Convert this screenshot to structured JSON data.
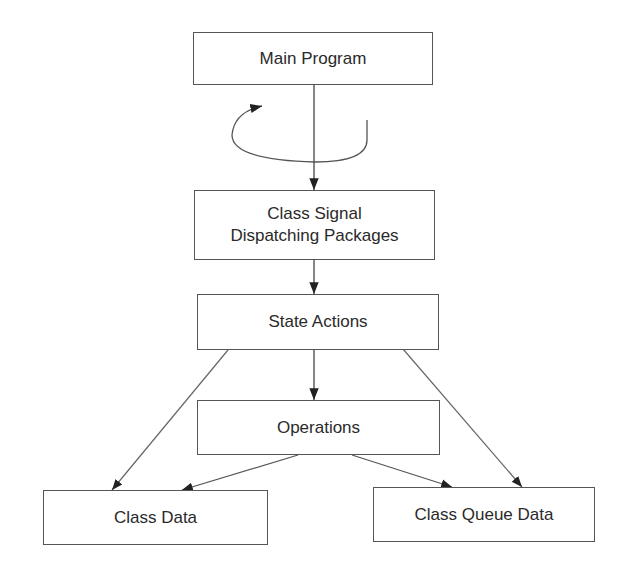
{
  "diagram": {
    "nodes": [
      {
        "id": "main_program",
        "label": "Main Program"
      },
      {
        "id": "class_signal",
        "label_line1": "Class Signal",
        "label_line2": "Dispatching Packages"
      },
      {
        "id": "state_actions",
        "label": "State Actions"
      },
      {
        "id": "operations",
        "label": "Operations"
      },
      {
        "id": "class_data",
        "label": "Class Data"
      },
      {
        "id": "class_queue_data",
        "label": "Class Queue Data"
      }
    ],
    "edges": [
      {
        "from": "main_program",
        "to": "class_signal"
      },
      {
        "from": "class_signal",
        "to": "class_signal",
        "type": "loop"
      },
      {
        "from": "class_signal",
        "to": "state_actions"
      },
      {
        "from": "state_actions",
        "to": "operations"
      },
      {
        "from": "state_actions",
        "to": "class_data"
      },
      {
        "from": "state_actions",
        "to": "class_queue_data"
      },
      {
        "from": "operations",
        "to": "class_data"
      },
      {
        "from": "operations",
        "to": "class_queue_data"
      }
    ]
  },
  "labels": {
    "main_program": "Main Program",
    "class_signal_1": "Class Signal",
    "class_signal_2": "Dispatching Packages",
    "state_actions": "State Actions",
    "operations": "Operations",
    "class_data": "Class Data",
    "class_queue_data": "Class Queue Data"
  }
}
